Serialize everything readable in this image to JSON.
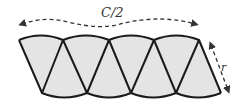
{
  "diagram": {
    "title_label": "C/2",
    "radius_label": "r",
    "colors": {
      "fill": "#e4e4e4",
      "stroke": "#1a1a1a",
      "arrow": "#333333",
      "background": "#ffffff"
    },
    "sector_count": 8,
    "top_vertices_x": [
      19,
      63,
      109,
      154,
      199
    ],
    "bottom_vertices_x": [
      42,
      87,
      131,
      176,
      221
    ],
    "top_y": 40,
    "bottom_y": 93
  }
}
